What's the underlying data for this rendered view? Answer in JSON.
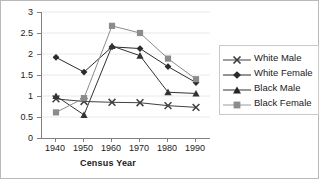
{
  "chart_data": {
    "type": "line",
    "title": "",
    "xlabel": "Census Year",
    "ylabel": "",
    "categories": [
      "1940",
      "1950",
      "1960",
      "1970",
      "1980",
      "1990"
    ],
    "x": [
      1940,
      1950,
      1960,
      1970,
      1980,
      1990
    ],
    "xlim": [
      1935,
      1995
    ],
    "ylim": [
      0,
      3
    ],
    "yticks": [
      "0",
      "0.5",
      "1",
      "1.5",
      "2",
      "2.5",
      "3"
    ],
    "ytick_values": [
      0,
      0.5,
      1,
      1.5,
      2,
      2.5,
      3
    ],
    "grid": true,
    "grid_axis": "y",
    "legend_position": "right",
    "series": [
      {
        "name": "White Male",
        "marker": "cross-marker",
        "color": "#404040",
        "values": [
          0.93,
          0.87,
          0.85,
          0.84,
          0.77,
          0.73
        ]
      },
      {
        "name": "White Female",
        "marker": "diamond-marker",
        "color": "#2b2b2b",
        "values": [
          1.92,
          1.57,
          2.17,
          2.13,
          1.7,
          1.32
        ]
      },
      {
        "name": "Black Male",
        "marker": "triangle-marker",
        "color": "#333333",
        "values": [
          1.0,
          0.55,
          2.19,
          1.96,
          1.09,
          1.06
        ]
      },
      {
        "name": "Black Female",
        "marker": "square-marker",
        "color": "#8c8c8c",
        "values": [
          0.61,
          0.95,
          2.67,
          2.5,
          1.89,
          1.4
        ]
      }
    ]
  },
  "legend": {
    "items": [
      {
        "label": "White Male"
      },
      {
        "label": "White Female"
      },
      {
        "label": "Black Male"
      },
      {
        "label": "Black Female"
      }
    ]
  },
  "colors": {
    "axis": "#808080",
    "grid": "#e8e8e8",
    "text": "#1a1a1a",
    "border": "#b9b9b9",
    "background": "#ffffff"
  }
}
